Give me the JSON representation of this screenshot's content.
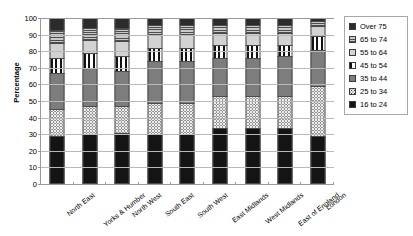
{
  "chart_data": {
    "type": "bar",
    "subtype": "stacked-bar-100-percent",
    "title": "",
    "xlabel": "",
    "ylabel": "Percentage",
    "ylim": [
      0,
      100
    ],
    "ytick_step": 10,
    "yticks": [
      0,
      10,
      20,
      30,
      40,
      50,
      60,
      70,
      80,
      90,
      100
    ],
    "grid": true,
    "legend_position": "right",
    "categories": [
      "North East",
      "Yorks & Humber",
      "North West",
      "South East",
      "South West",
      "East Midlands",
      "West Midlands",
      "East of England",
      "London"
    ],
    "series": [
      {
        "name": "16 to 24",
        "values": [
          29,
          30,
          31,
          30,
          30,
          34,
          34,
          34,
          29
        ]
      },
      {
        "name": "25 to 34",
        "values": [
          16,
          17,
          16,
          19,
          19,
          19,
          19,
          19,
          30
        ]
      },
      {
        "name": "35 to 44",
        "values": [
          22,
          23,
          21,
          25,
          25,
          23,
          23,
          24,
          22
        ]
      },
      {
        "name": "45 to 54",
        "values": [
          9,
          9,
          9,
          8,
          8,
          8,
          8,
          7,
          8
        ]
      },
      {
        "name": "55 to 64",
        "values": [
          9,
          8,
          9,
          8,
          8,
          7,
          7,
          7,
          6
        ]
      },
      {
        "name": "65 to 74",
        "values": [
          8,
          7,
          8,
          6,
          6,
          5,
          5,
          5,
          3
        ]
      },
      {
        "name": "Over 75",
        "values": [
          7,
          6,
          6,
          4,
          4,
          4,
          4,
          4,
          2
        ]
      }
    ],
    "series_order_bottom_to_top": [
      "16 to 24",
      "25 to 34",
      "35 to 44",
      "45 to 54",
      "55 to 64",
      "65 to 74",
      "Over 75"
    ]
  },
  "legend": {
    "items": [
      {
        "label": "Over 75",
        "key": "over75"
      },
      {
        "label": "65 to 74",
        "key": "65to74"
      },
      {
        "label": "55 to 64",
        "key": "55to64"
      },
      {
        "label": "45 to 54",
        "key": "45to54"
      },
      {
        "label": "35 to 44",
        "key": "35to44"
      },
      {
        "label": "25 to 34",
        "key": "25to34"
      },
      {
        "label": "16 to 24",
        "key": "16to24"
      }
    ]
  },
  "colors": {
    "over75": "#2b2b2b",
    "65to74": "#8a8a8a",
    "55to64": "#d2d2d2",
    "45to54": "#121212",
    "35to44": "#7d7d7d",
    "25to34": "#ededed",
    "16to24": "#141414",
    "gridline": "#b9b9b9",
    "axis": "#9a9a9a",
    "background": "#ffffff",
    "text": "#000000"
  }
}
